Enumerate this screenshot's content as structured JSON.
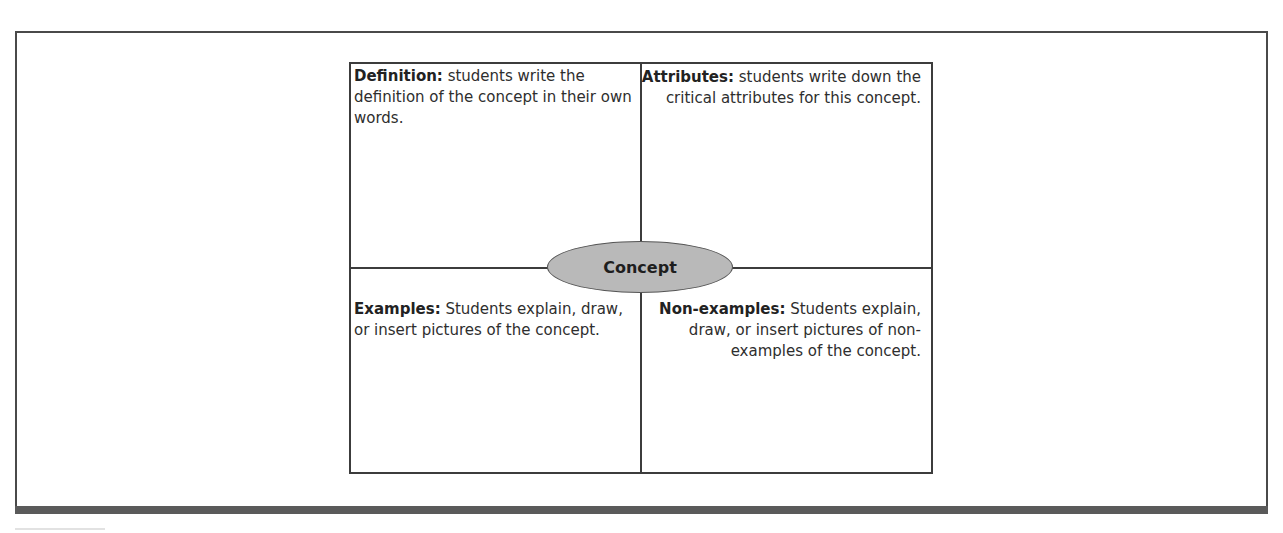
{
  "diagram": {
    "type": "frayer-model",
    "center": {
      "label": "Concept"
    },
    "quadrants": [
      {
        "position": "top-left",
        "title": "Definition:",
        "text": " students write the definition of the concept in their own words."
      },
      {
        "position": "top-right",
        "title": "Attributes:",
        "text": " students write down the critical attributes for this concept."
      },
      {
        "position": "bottom-left",
        "title": "Examples:",
        "text": " Students explain, draw, or insert pictures of the concept."
      },
      {
        "position": "bottom-right",
        "title": "Non-examples:",
        "text": " Students explain, draw, or insert pictures of non-examples of the concept."
      }
    ],
    "colors": {
      "oval_fill": "#b9b9b9",
      "border": "#3c3c3c",
      "frame_bottom_bar": "#5a5a5a"
    }
  }
}
